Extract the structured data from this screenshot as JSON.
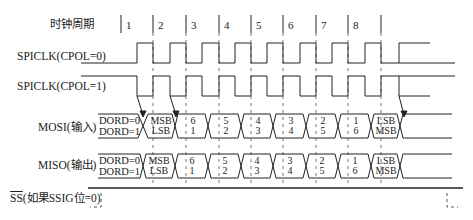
{
  "header": {
    "clock_cycle_label": "时钟周期"
  },
  "cycles": [
    "1",
    "2",
    "3",
    "4",
    "5",
    "6",
    "7",
    "8"
  ],
  "signals": {
    "spiclk_cpol0": "SPICLK(CPOL=0)",
    "spiclk_cpol1": "SPICLK(CPOL=1)",
    "mosi": "MOSI(输入)",
    "miso": "MISO(输出)",
    "ss_bar": "SS",
    "ss_suffix": "(如果SSIG位=0)"
  },
  "dord": {
    "zero": "DORD=0",
    "one": "DORD=1"
  },
  "mosi_bits": [
    {
      "top": "MSB",
      "bottom": "LSB"
    },
    {
      "top": "6",
      "bottom": "1"
    },
    {
      "top": "5",
      "bottom": "2"
    },
    {
      "top": "4",
      "bottom": "3"
    },
    {
      "top": "3",
      "bottom": "4"
    },
    {
      "top": "2",
      "bottom": "5"
    },
    {
      "top": "1",
      "bottom": "6"
    },
    {
      "top": "LSB",
      "bottom": "MSB"
    }
  ],
  "miso_bits": [
    {
      "top": "MSB",
      "bottom": "LSB"
    },
    {
      "top": "6",
      "bottom": "1"
    },
    {
      "top": "5",
      "bottom": "2"
    },
    {
      "top": "4",
      "bottom": "3"
    },
    {
      "top": "3",
      "bottom": "4"
    },
    {
      "top": "2",
      "bottom": "5"
    },
    {
      "top": "1",
      "bottom": "6"
    },
    {
      "top": "LSB",
      "bottom": "MSB"
    }
  ],
  "colors": {
    "line": "#222222",
    "dash": "#666666",
    "background": "#ffffff"
  }
}
